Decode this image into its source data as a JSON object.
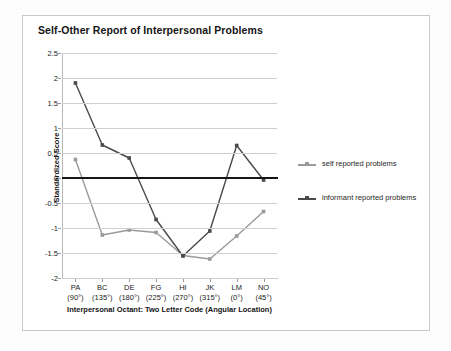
{
  "chart_data": {
    "type": "line",
    "title": "Self-Other Report of Interpersonal Problems",
    "xlabel": "Interpersonal Octant: Two Letter Code (Angular Location)",
    "ylabel": "Standardized Score",
    "categories": [
      "PA",
      "BC",
      "DE",
      "FG",
      "HI",
      "JK",
      "LM",
      "NO"
    ],
    "category_angles": [
      "(90°)",
      "(135°)",
      "(180°)",
      "(225°)",
      "(270°)",
      "(315°)",
      "(0°)",
      "(45°)"
    ],
    "ylim": [
      -2,
      2.5
    ],
    "yticks": [
      2.5,
      2,
      1.5,
      1,
      0.5,
      0,
      -0.5,
      -1,
      -1.5,
      -2
    ],
    "ytick_labels": [
      "2.5",
      "2",
      "1.5",
      "1",
      "0.5",
      "0",
      "-0.5",
      "-1",
      "-1.5",
      "-2"
    ],
    "grid": true,
    "legend_position": "right",
    "zero_line": true,
    "series": [
      {
        "name": "self reported problems",
        "color": "#9a9a9a",
        "values": [
          0.37,
          -1.14,
          -1.04,
          -1.09,
          -1.55,
          -1.62,
          -1.16,
          -0.67
        ]
      },
      {
        "name": "informant reported problems",
        "color": "#4a4a4a",
        "values": [
          1.9,
          0.66,
          0.4,
          -0.83,
          -1.56,
          -1.06,
          0.65,
          -0.04
        ]
      }
    ]
  },
  "figure": {
    "frame_color": "#c9c9c9",
    "background": "#ffffff"
  }
}
